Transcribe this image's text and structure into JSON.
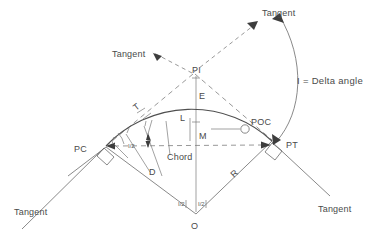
{
  "diagram": {
    "note": {
      "text": "I = Delta angle"
    },
    "points": {
      "pi": "PI",
      "pc": "PC",
      "pt": "PT",
      "poc": "POC",
      "o": "O"
    },
    "dimensions": {
      "external": "E",
      "long_tangent": "T",
      "arc_length": "L",
      "middle_ordinate": "M",
      "chord": "Chord",
      "radius": "R",
      "deflection": "D"
    },
    "angles": {
      "half_delta_pc": "I/2",
      "half_delta_left": "I/2",
      "half_delta_right": "I/2"
    },
    "tangents": {
      "top_left": "Tangent",
      "top_right": "Tangent",
      "bottom_left": "Tangent",
      "bottom_right": "Tangent"
    },
    "colors": {
      "line": "#6b6b6b",
      "text": "#4a4a4a",
      "background": "#ffffff"
    }
  }
}
